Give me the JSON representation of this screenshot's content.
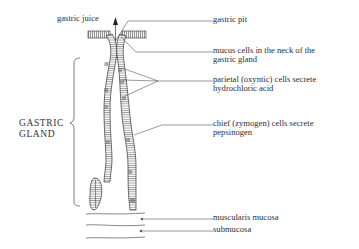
{
  "diagram": {
    "top_label": "gastric juice",
    "side_label": {
      "line1": "GASTRIC",
      "line2": "GLAND"
    },
    "labels": [
      {
        "id": "gastric-pit",
        "lines": [
          "gastric pit"
        ]
      },
      {
        "id": "mucus-cells",
        "lines": [
          "mucus cells in the neck of the",
          "gastric gland"
        ]
      },
      {
        "id": "parietal-cells",
        "lines": [
          "parietal (oxyntic) cells secrete",
          "hydrochloric acid"
        ]
      },
      {
        "id": "chief-cells",
        "lines": [
          "chief (zymogen) cells secrete",
          "pepsinogen"
        ]
      },
      {
        "id": "muscularis-mucosa",
        "lines": [
          "muscularis mucosa"
        ]
      },
      {
        "id": "submucosa",
        "lines": [
          "submucosa"
        ]
      }
    ],
    "colors": {
      "ink": "#2e2e2e",
      "line": "#555555",
      "background": "#ffffff"
    }
  }
}
